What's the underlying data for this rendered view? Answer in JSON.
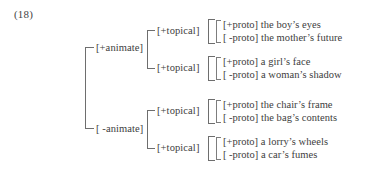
{
  "figure": {
    "example_number": "(18)",
    "root_branches": [
      {
        "label": "[+animate]",
        "subnodes": [
          {
            "label": "[+topical]",
            "leaves": [
              {
                "feature": "[+proto]",
                "text": "the boy’s eyes"
              },
              {
                "feature": "[ -proto]",
                "text": "the mother’s future"
              }
            ]
          },
          {
            "label": "[+topical]",
            "leaves": [
              {
                "feature": "[+proto]",
                "text": "a girl’s face"
              },
              {
                "feature": "[ -proto]",
                "text": "a woman’s shadow"
              }
            ]
          }
        ]
      },
      {
        "label": "[ -animate]",
        "subnodes": [
          {
            "label": "[+topical]",
            "leaves": [
              {
                "feature": "[+proto]",
                "text": "the chair’s frame"
              },
              {
                "feature": "[ -proto]",
                "text": "the bag’s contents"
              }
            ]
          },
          {
            "label": "[+topical]",
            "leaves": [
              {
                "feature": "[+proto]",
                "text": "a lorry’s wheels"
              },
              {
                "feature": "[ -proto]",
                "text": "a car’s fumes"
              }
            ]
          }
        ]
      }
    ],
    "colors": {
      "background": "#ffffff",
      "text": "#3d3d3d",
      "bracket": "#6e6e6e"
    }
  }
}
